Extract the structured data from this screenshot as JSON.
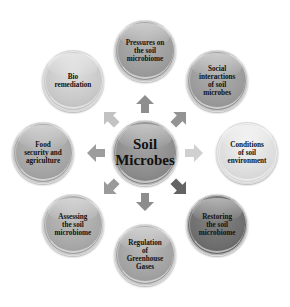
{
  "diagram": {
    "center": {
      "label": "Soil\nMicrobes",
      "color": "#8c8c8c"
    },
    "nodes": [
      {
        "id": "pressures",
        "label": "Pressures on\nthe soil\nmicrobiome",
        "color": "#9c9c9c",
        "arrow_color": "#8e8e8e"
      },
      {
        "id": "social",
        "label": "Social\ninteractions\nof soil\nmicrobes",
        "color": "#9a9a9a",
        "arrow_color": "#939393"
      },
      {
        "id": "conditions",
        "label": "Conditions\nof soil\nenvironment",
        "color": "#dcdcdc",
        "arrow_color": "#d0d0d0"
      },
      {
        "id": "restoring",
        "label": "Restoring\nthe soil\nmicrobiome",
        "color": "#6e6e6e",
        "arrow_color": "#636363"
      },
      {
        "id": "regulation",
        "label": "Regulation\nof\nGreenhouse\nGases",
        "color": "#a2a2a2",
        "arrow_color": "#8d8d8d"
      },
      {
        "id": "assessing",
        "label": "Assessing\nthe soil\nmicrobiome",
        "color": "#a8a8a8",
        "arrow_color": "#9a9a9a"
      },
      {
        "id": "food",
        "label": "Food\nsecurity and\nagriculture",
        "color": "#a4a4a4",
        "arrow_color": "#9d9d9d"
      },
      {
        "id": "bio",
        "label": "Bio\nremediation",
        "color": "#c8c8c8",
        "arrow_color": "#c2c2c2"
      }
    ]
  }
}
